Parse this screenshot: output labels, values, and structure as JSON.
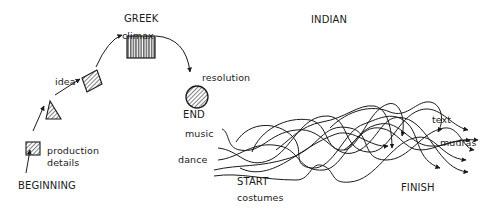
{
  "greek": {
    "title": "GREEK",
    "stages": {
      "beginning": "BEGINNING",
      "production_details": [
        "production",
        "details"
      ],
      "idea": "idea",
      "climax": "climax",
      "resolution": "resolution",
      "end": "END"
    }
  },
  "indian": {
    "title": "INDIAN",
    "inputs": {
      "music": "music",
      "dance": "dance",
      "start": "START",
      "costumes": "costumes"
    },
    "outputs": {
      "text": "text",
      "mudras": "mudras",
      "finish": "FINISH"
    }
  },
  "colors": {
    "ink": "#1a1a1a",
    "background": "#ffffff"
  }
}
